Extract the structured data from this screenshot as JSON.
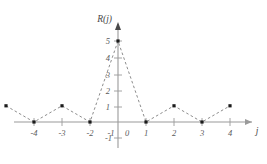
{
  "chart_data": {
    "type": "scatter",
    "title": "",
    "subtitle": "",
    "xlabel": "j",
    "ylabel": "R(j)",
    "x": [
      -4,
      -3,
      -2,
      -1,
      0,
      1,
      2,
      3,
      4
    ],
    "values": [
      1,
      0,
      1,
      0,
      5,
      0,
      1,
      0,
      1
    ],
    "series": [
      {
        "name": "R(j)",
        "x": [
          -4,
          -3,
          -2,
          -1,
          0,
          1,
          2,
          3,
          4
        ],
        "values": [
          1,
          0,
          1,
          0,
          5,
          0,
          1,
          0,
          1
        ]
      }
    ],
    "xlim": [
      -4.9,
      4.9
    ],
    "ylim": [
      -1.6,
      5.6
    ],
    "xticks": [
      -4,
      -3,
      -2,
      -1,
      0,
      1,
      2,
      3,
      4
    ],
    "xtick_labels": [
      "-4",
      "-3",
      "-2",
      "-1",
      "0",
      "1",
      "2",
      "3",
      "4"
    ],
    "yticks": [
      -1,
      1,
      2,
      3,
      4,
      5
    ],
    "ytick_labels": [
      "-1",
      "1",
      "2",
      "3",
      "4",
      "5"
    ],
    "origin_label": "0",
    "grid": false,
    "legend": false,
    "line_style": "dashed",
    "marker_style": "filled-square",
    "colors": {
      "axis": "#9a9a9a",
      "curve": "#8d8d8d",
      "marker": "#1b1b1b",
      "text": "#5b5b5b",
      "background": "#ffffff"
    }
  }
}
